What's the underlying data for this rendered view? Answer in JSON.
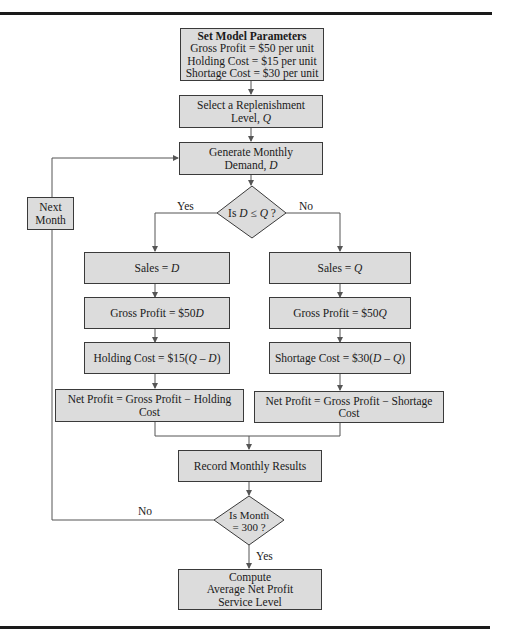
{
  "diagram": {
    "type": "flowchart",
    "colors": {
      "box_fill": "#dcdcdc",
      "stroke": "#3a3a3a",
      "rule": "#1a1a1a"
    },
    "nodes": {
      "params": {
        "title": "Set Model Parameters",
        "line1": "Gross Profit = $50 per unit",
        "line2": "Holding Cost = $15 per unit",
        "line3": "Shortage Cost = $30 per unit"
      },
      "select_q": {
        "line1": "Select a Replenishment",
        "line2_prefix": "Level, ",
        "line2_var": "Q"
      },
      "generate_d": {
        "line1": "Generate Monthly",
        "line2_prefix": "Demand, ",
        "line2_var": "D"
      },
      "decision_dq": {
        "prefix": "Is ",
        "var1": "D",
        "op": " ≤ ",
        "var2": "Q",
        "suffix": " ?"
      },
      "sales_d": {
        "prefix": "Sales = ",
        "var": "D"
      },
      "gross_d": {
        "prefix": "Gross Profit = $50",
        "var": "D"
      },
      "holding": {
        "prefix": "Holding Cost = $15(",
        "expr": "Q – D",
        "suffix": ")"
      },
      "net_left": {
        "text": "Net Profit = Gross Profit − Holding Cost"
      },
      "sales_q": {
        "prefix": "Sales = ",
        "var": "Q"
      },
      "gross_q": {
        "prefix": "Gross Profit = $50",
        "var": "Q"
      },
      "shortage": {
        "prefix": "Shortage Cost = $30(",
        "expr": "D – Q",
        "suffix": ")"
      },
      "net_right": {
        "text": "Net Profit = Gross Profit − Shortage Cost"
      },
      "record": {
        "text": "Record Monthly Results"
      },
      "decision_month": {
        "line1": "Is Month",
        "line2": "= 300 ?"
      },
      "compute": {
        "line1": "Compute",
        "line2": "Average Net Profit",
        "line3": "Service Level"
      },
      "next_month": {
        "line1": "Next",
        "line2": "Month"
      }
    },
    "edge_labels": {
      "yes_left": "Yes",
      "no_right": "No",
      "no_loop": "No",
      "yes_down": "Yes"
    }
  }
}
